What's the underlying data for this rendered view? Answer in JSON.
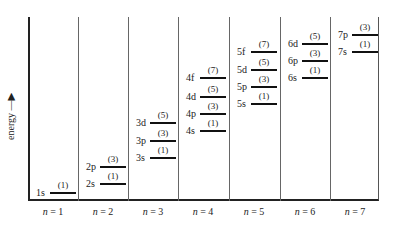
{
  "diagram": {
    "y_axis_label": "energy",
    "columns": [
      {
        "label_var": "n",
        "label_val": "= 1",
        "x": 28
      },
      {
        "label_var": "n",
        "label_val": "= 2",
        "x": 78
      },
      {
        "label_var": "n",
        "label_val": "= 3",
        "x": 128
      },
      {
        "label_var": "n",
        "label_val": "= 4",
        "x": 178
      },
      {
        "label_var": "n",
        "label_val": "= 5",
        "x": 229
      },
      {
        "label_var": "n",
        "label_val": "= 6",
        "x": 280
      },
      {
        "label_var": "n",
        "label_val": "= 7",
        "x": 330
      }
    ],
    "levels": [
      {
        "orbital": "1s",
        "degeneracy": "(1)",
        "col": 0,
        "y": 192
      },
      {
        "orbital": "2s",
        "degeneracy": "(1)",
        "col": 1,
        "y": 183
      },
      {
        "orbital": "2p",
        "degeneracy": "(3)",
        "col": 1,
        "y": 166
      },
      {
        "orbital": "3s",
        "degeneracy": "(1)",
        "col": 2,
        "y": 157
      },
      {
        "orbital": "3p",
        "degeneracy": "(3)",
        "col": 2,
        "y": 140
      },
      {
        "orbital": "3d",
        "degeneracy": "(5)",
        "col": 2,
        "y": 122
      },
      {
        "orbital": "4s",
        "degeneracy": "(1)",
        "col": 3,
        "y": 130
      },
      {
        "orbital": "4p",
        "degeneracy": "(3)",
        "col": 3,
        "y": 113
      },
      {
        "orbital": "4d",
        "degeneracy": "(5)",
        "col": 3,
        "y": 96
      },
      {
        "orbital": "4f",
        "degeneracy": "(7)",
        "col": 3,
        "y": 77
      },
      {
        "orbital": "5s",
        "degeneracy": "(1)",
        "col": 4,
        "y": 103
      },
      {
        "orbital": "5p",
        "degeneracy": "(3)",
        "col": 4,
        "y": 86
      },
      {
        "orbital": "5d",
        "degeneracy": "(5)",
        "col": 4,
        "y": 69
      },
      {
        "orbital": "5f",
        "degeneracy": "(7)",
        "col": 4,
        "y": 51
      },
      {
        "orbital": "6s",
        "degeneracy": "(1)",
        "col": 5,
        "y": 77
      },
      {
        "orbital": "6p",
        "degeneracy": "(3)",
        "col": 5,
        "y": 60
      },
      {
        "orbital": "6d",
        "degeneracy": "(5)",
        "col": 5,
        "y": 43
      },
      {
        "orbital": "7s",
        "degeneracy": "(1)",
        "col": 6,
        "y": 51
      },
      {
        "orbital": "7p",
        "degeneracy": "(3)",
        "col": 6,
        "y": 34
      }
    ]
  }
}
